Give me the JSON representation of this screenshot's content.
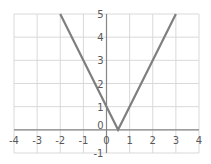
{
  "chart_data": {
    "type": "line",
    "title": "",
    "xlabel": "",
    "ylabel": "",
    "xlim": [
      -4,
      4
    ],
    "ylim": [
      -1,
      5
    ],
    "grid": true,
    "legend": null,
    "x_ticks": [
      "-4",
      "-3",
      "-2",
      "-1",
      "0",
      "1",
      "2",
      "3",
      "4"
    ],
    "y_ticks": [
      "-1",
      "0",
      "1",
      "2",
      "3",
      "4",
      "5"
    ],
    "series": [
      {
        "name": "y = |2x - 1|",
        "x": [
          -2,
          0.5,
          3
        ],
        "y": [
          5,
          0,
          5
        ],
        "color": "#7f7f7f"
      }
    ]
  },
  "colors": {
    "grid": "#d9d9d9",
    "axis": "#868686",
    "line": "#7f7f7f",
    "tick_text": "#595959"
  }
}
